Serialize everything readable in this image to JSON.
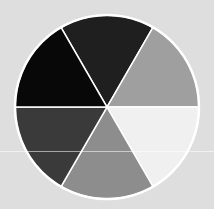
{
  "image": {
    "subject": "grayscale color wheel",
    "background_color": "#dedede",
    "wheel": {
      "center": [
        107,
        107
      ],
      "radius": 92,
      "border_color": "#ffffff",
      "segments": [
        {
          "position": "top",
          "color": "#1f1f1f"
        },
        {
          "position": "top-right",
          "color": "#9f9f9f"
        },
        {
          "position": "bottom-right",
          "color": "#f0f0f0"
        },
        {
          "position": "bottom",
          "color": "#8d8d8d"
        },
        {
          "position": "bottom-left",
          "color": "#3a3a3a"
        },
        {
          "position": "top-left",
          "color": "#080808"
        }
      ]
    }
  }
}
